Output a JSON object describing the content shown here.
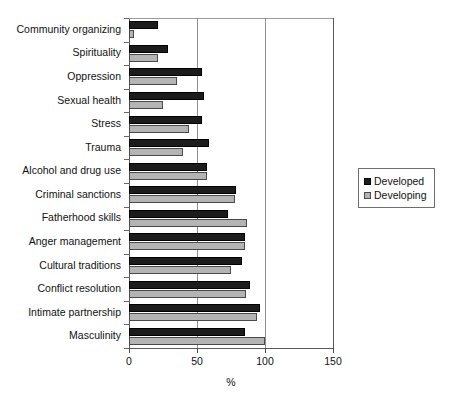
{
  "chart_data": {
    "type": "bar",
    "orientation": "horizontal",
    "title": "",
    "subtitle": "",
    "xlabel": "%",
    "ylabel": "",
    "xlim": [
      0,
      150
    ],
    "xticks": [
      0,
      50,
      100,
      150
    ],
    "xtick_labels": [
      "0",
      "50",
      "100",
      "150"
    ],
    "grid": "vertical gridlines at 50 and 100",
    "legend_position": "right",
    "categories": [
      "Community organizing",
      "Spirituality",
      "Oppression",
      "Sexual health",
      "Stress",
      "Trauma",
      "Alcohol and drug use",
      "Criminal sanctions",
      "Fatherhood skills",
      "Anger management",
      "Cultural traditions",
      "Conflict resolution",
      "Intimate partnership",
      "Masculinity"
    ],
    "series": [
      {
        "name": "Developed",
        "color": "#1c1c1c",
        "values": [
          21,
          29,
          54,
          55,
          54,
          59,
          57,
          79,
          73,
          85,
          83,
          89,
          96,
          85
        ]
      },
      {
        "name": "Developing",
        "color": "#b4b4b4",
        "values": [
          4,
          21,
          35,
          25,
          44,
          40,
          57,
          78,
          87,
          85,
          75,
          86,
          94,
          100
        ]
      }
    ]
  },
  "legend": {
    "items": [
      {
        "label": "Developed",
        "swatch": "developed"
      },
      {
        "label": "Developing",
        "swatch": "developing"
      }
    ]
  },
  "axis": {
    "x_title": "%"
  }
}
